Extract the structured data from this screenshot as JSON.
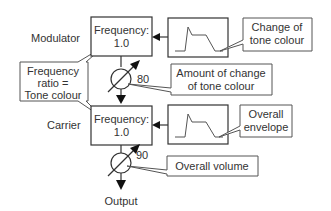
{
  "modulator": {
    "label": "Modulator",
    "box_line1": "Frequency:",
    "box_line2": "1.0"
  },
  "carrier": {
    "label": "Carrier",
    "box_line1": "Frequency:",
    "box_line2": "1.0"
  },
  "callouts": {
    "frequency_ratio": {
      "line1": "Frequency",
      "line2": "ratio =",
      "line3": "Tone colour"
    },
    "change_tone": {
      "line1": "Change of",
      "line2": "tone colour"
    },
    "amount_change": {
      "line1": "Amount of change",
      "line2": "of tone colour"
    },
    "overall_envelope": {
      "line1": "Overall",
      "line2": "envelope"
    },
    "overall_volume": {
      "line1": "Overall volume"
    }
  },
  "knobs": {
    "modulator_level": "80",
    "carrier_level": "90"
  },
  "output": {
    "label": "Output"
  },
  "colors": {
    "stroke": "#333333",
    "arrow": "#111111",
    "background": "#ffffff"
  }
}
